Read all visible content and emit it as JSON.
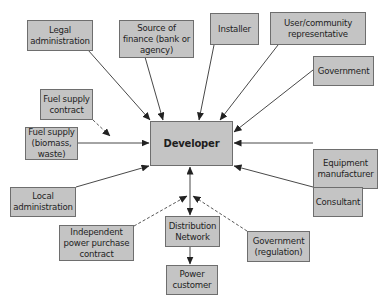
{
  "diagram": {
    "title": "",
    "center": {
      "id": "developer",
      "label": "Developer"
    },
    "nodes": {
      "legal_admin": {
        "label": "Legal administration"
      },
      "finance": {
        "label": "Source of finance (bank or agency)"
      },
      "installer": {
        "label": "Installer"
      },
      "user_rep": {
        "label": "User/community representative"
      },
      "government": {
        "label": "Government"
      },
      "fuel_contract": {
        "label": "Fuel supply contract"
      },
      "fuel_supply": {
        "label": "Fuel supply (biomass, waste)"
      },
      "developer": {
        "label": "Developer"
      },
      "equipment": {
        "label": "Equipment manufacturer"
      },
      "local_admin": {
        "label": "Local administration"
      },
      "consultant": {
        "label": "Consultant"
      },
      "ippc": {
        "label": "Independent power purchase contract"
      },
      "distribution": {
        "label": "Distribution Network"
      },
      "gov_regulation": {
        "label": "Government (regulation)"
      },
      "power_customer": {
        "label": "Power customer"
      }
    },
    "edges": [
      {
        "from": "Legal administration",
        "to": "Developer",
        "style": "solid"
      },
      {
        "from": "Source of finance (bank or agency)",
        "to": "Developer",
        "style": "solid"
      },
      {
        "from": "Installer",
        "to": "Developer",
        "style": "solid"
      },
      {
        "from": "User/community representative",
        "to": "Developer",
        "style": "solid"
      },
      {
        "from": "Government",
        "to": "Developer",
        "style": "solid"
      },
      {
        "from": "Fuel supply contract",
        "to": "Fuel supply link",
        "style": "dashed"
      },
      {
        "from": "Fuel supply (biomass, waste)",
        "to": "Developer",
        "style": "solid"
      },
      {
        "from": "Equipment manufacturer",
        "to": "Developer",
        "style": "solid"
      },
      {
        "from": "Local administration",
        "to": "Developer",
        "style": "solid"
      },
      {
        "from": "Consultant",
        "to": "Developer",
        "style": "solid"
      },
      {
        "from": "Developer",
        "to": "Distribution Network",
        "style": "solid-bidirectional"
      },
      {
        "from": "Independent power purchase contract",
        "to": "Developer-Distribution link",
        "style": "dashed"
      },
      {
        "from": "Government (regulation)",
        "to": "Developer-Distribution link",
        "style": "dashed"
      },
      {
        "from": "Distribution Network",
        "to": "Power customer",
        "style": "solid"
      }
    ],
    "colors": {
      "box_fill": "#c4c4c4",
      "box_border": "#6e6e6e",
      "line": "#333333",
      "text": "#1e1e1e"
    }
  }
}
